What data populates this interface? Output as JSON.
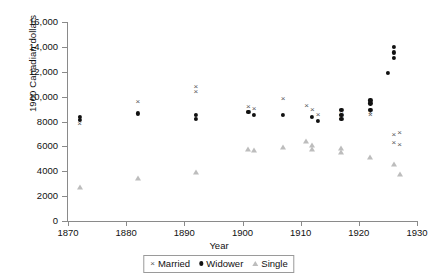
{
  "chart_data": {
    "type": "scatter",
    "title": "",
    "xlabel": "Year",
    "ylabel": "1900 Canadian dollars",
    "xlim": [
      1870,
      1930
    ],
    "ylim": [
      0,
      16000
    ],
    "xticks": [
      1870,
      1880,
      1890,
      1900,
      1910,
      1920,
      1930
    ],
    "xtick_labels": [
      "1870",
      "1880",
      "1890",
      "1900",
      "1910",
      "1920",
      "1930"
    ],
    "yticks": [
      0,
      2000,
      4000,
      6000,
      8000,
      10000,
      12000,
      14000,
      16000
    ],
    "ytick_labels": [
      "0",
      "2000",
      "4000",
      "6000",
      "8000",
      "10,000",
      "12,000",
      "14,000",
      "16,000"
    ],
    "grid": false,
    "legend_position": "bottom-center",
    "series": [
      {
        "name": "Married",
        "marker": "x",
        "color": "#59595b",
        "points": [
          {
            "x": 1872,
            "y": 7800
          },
          {
            "x": 1882,
            "y": 9550
          },
          {
            "x": 1892,
            "y": 10800
          },
          {
            "x": 1892,
            "y": 10400
          },
          {
            "x": 1901,
            "y": 9150
          },
          {
            "x": 1901,
            "y": 8800
          },
          {
            "x": 1902,
            "y": 9000
          },
          {
            "x": 1907,
            "y": 9800
          },
          {
            "x": 1911,
            "y": 9250
          },
          {
            "x": 1912,
            "y": 8900
          },
          {
            "x": 1913,
            "y": 8500
          },
          {
            "x": 1917,
            "y": 8600
          },
          {
            "x": 1917,
            "y": 8300
          },
          {
            "x": 1922,
            "y": 8700
          },
          {
            "x": 1922,
            "y": 8500
          },
          {
            "x": 1926,
            "y": 6900
          },
          {
            "x": 1927,
            "y": 7100
          },
          {
            "x": 1926,
            "y": 6300
          },
          {
            "x": 1927,
            "y": 6150
          }
        ]
      },
      {
        "name": "Widower",
        "marker": "circle",
        "color": "#111111",
        "points": [
          {
            "x": 1872,
            "y": 8400
          },
          {
            "x": 1872,
            "y": 8150
          },
          {
            "x": 1882,
            "y": 8650
          },
          {
            "x": 1892,
            "y": 8550
          },
          {
            "x": 1892,
            "y": 8200
          },
          {
            "x": 1901,
            "y": 8800
          },
          {
            "x": 1902,
            "y": 8550
          },
          {
            "x": 1907,
            "y": 8500
          },
          {
            "x": 1912,
            "y": 8400
          },
          {
            "x": 1913,
            "y": 8050
          },
          {
            "x": 1917,
            "y": 8900
          },
          {
            "x": 1917,
            "y": 8500
          },
          {
            "x": 1917,
            "y": 8200
          },
          {
            "x": 1922,
            "y": 9700
          },
          {
            "x": 1922,
            "y": 9450
          },
          {
            "x": 1922,
            "y": 8900
          },
          {
            "x": 1926,
            "y": 14000
          },
          {
            "x": 1926,
            "y": 13550
          },
          {
            "x": 1926,
            "y": 13100
          },
          {
            "x": 1925,
            "y": 11900
          }
        ]
      },
      {
        "name": "Single",
        "marker": "triangle",
        "color": "#bdbdbd",
        "points": [
          {
            "x": 1872,
            "y": 2700
          },
          {
            "x": 1882,
            "y": 3450
          },
          {
            "x": 1892,
            "y": 3950
          },
          {
            "x": 1901,
            "y": 5800
          },
          {
            "x": 1902,
            "y": 5700
          },
          {
            "x": 1907,
            "y": 5950
          },
          {
            "x": 1911,
            "y": 6450
          },
          {
            "x": 1912,
            "y": 6100
          },
          {
            "x": 1912,
            "y": 5750
          },
          {
            "x": 1917,
            "y": 5900
          },
          {
            "x": 1917,
            "y": 5550
          },
          {
            "x": 1922,
            "y": 5150
          },
          {
            "x": 1926,
            "y": 4600
          },
          {
            "x": 1927,
            "y": 3750
          }
        ]
      }
    ]
  },
  "legend": {
    "items": [
      {
        "label": "Married",
        "icon": "x-marker-icon"
      },
      {
        "label": "Widower",
        "icon": "circle-marker-icon"
      },
      {
        "label": "Single",
        "icon": "triangle-marker-icon"
      }
    ]
  }
}
